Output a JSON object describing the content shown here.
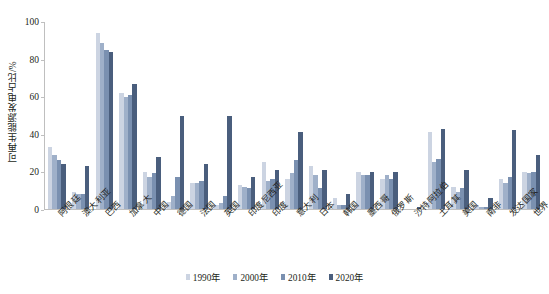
{
  "chart_data": {
    "type": "bar",
    "title": "",
    "xlabel": "",
    "ylabel": "可再生能源发电占比/%",
    "ylim": [
      0,
      100
    ],
    "yticks": [
      "0",
      "20",
      "40",
      "60",
      "80",
      "100"
    ],
    "grid": false,
    "legend_position": "bottom",
    "categories": [
      "阿根廷",
      "澳大利亚",
      "巴西",
      "加拿大",
      "中国",
      "德国",
      "法国",
      "英国",
      "印度尼西亚",
      "印度",
      "意大利",
      "日本",
      "韩国",
      "墨西哥",
      "俄罗斯",
      "沙特阿拉伯",
      "土耳其",
      "美国",
      "南非",
      "发达国家",
      "世界"
    ],
    "series": [
      {
        "name": "1990年",
        "color": "#ccd4e2",
        "values": [
          33,
          9,
          94,
          62,
          20,
          4,
          14,
          2,
          13,
          25,
          16,
          23,
          6,
          20,
          16,
          0,
          41,
          12,
          2,
          16,
          20
        ]
      },
      {
        "name": "2000年",
        "color": "#9fb0c9",
        "values": [
          29,
          8,
          89,
          60,
          17,
          7,
          14,
          3,
          12,
          15,
          19,
          18,
          2,
          18,
          18,
          0,
          25,
          9,
          1,
          14,
          19
        ]
      },
      {
        "name": "2010年",
        "color": "#7a90b0",
        "values": [
          26,
          8,
          85,
          61,
          19,
          17,
          15,
          7,
          11,
          16,
          26,
          11,
          2,
          18,
          16,
          0,
          27,
          11,
          1,
          17,
          20
        ]
      },
      {
        "name": "2020年",
        "color": "#4a5e7d",
        "values": [
          24,
          23,
          84,
          67,
          28,
          50,
          24,
          50,
          17,
          21,
          41,
          21,
          8,
          20,
          20,
          1,
          43,
          21,
          6,
          42,
          29
        ]
      }
    ]
  }
}
